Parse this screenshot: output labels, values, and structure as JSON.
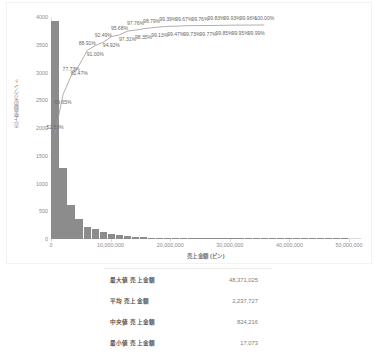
{
  "chart_data": {
    "type": "bar",
    "title": "",
    "xlabel": "売上金額 (ビン)",
    "ylabel": "売上金額のカウント",
    "xlim": [
      0,
      52000000
    ],
    "ylim": [
      0,
      4000
    ],
    "grid": false,
    "legend": "none",
    "xticks": [
      "0",
      "10,000,000",
      "20,000,000",
      "30,000,000",
      "40,000,000",
      "50,000,000"
    ],
    "xtick_values": [
      0,
      10000000,
      20000000,
      30000000,
      40000000,
      50000000
    ],
    "yticks": [
      "0",
      "500",
      "1000",
      "1500",
      "2000",
      "2500",
      "3000",
      "3500",
      "4000"
    ],
    "ytick_values": [
      0,
      500,
      1000,
      1500,
      2000,
      2500,
      3000,
      3500,
      4000
    ],
    "bin_width": 1350000,
    "categories": [
      "0",
      "1,350,000",
      "2,700,000",
      "4,050,000",
      "5,400,000",
      "6,750,000",
      "8,100,000",
      "9,450,000",
      "10,800,000",
      "12,150,000",
      "13,500,000",
      "14,850,000",
      "16,200,000",
      "17,550,000",
      "18,900,000",
      "20,250,000",
      "21,600,000",
      "22,950,000",
      "24,300,000",
      "25,650,000",
      "27,000,000",
      "28,350,000",
      "29,700,000",
      "31,050,000",
      "32,400,000",
      "33,750,000",
      "35,100,000",
      "36,450,000",
      "37,800,000",
      "39,150,000",
      "40,500,000",
      "41,850,000",
      "43,200,000",
      "44,550,000",
      "45,900,000",
      "47,250,000",
      "48,600,000"
    ],
    "values": [
      3925,
      1280,
      604,
      361,
      222,
      176,
      122,
      92,
      69,
      54,
      41,
      33,
      26,
      20,
      16,
      13,
      11,
      9,
      7,
      6,
      5,
      4,
      4,
      3,
      3,
      2,
      2,
      2,
      1,
      1,
      1,
      1,
      1,
      1,
      1,
      1,
      1
    ],
    "cumulative_label": "累積 %",
    "cumulative_percent": [
      52.53,
      69.65,
      77.73,
      82.47,
      88.91,
      91.0,
      92.49,
      94.92,
      95.68,
      97.31,
      97.76,
      98.35,
      98.79,
      99.13,
      99.39,
      99.47,
      99.67,
      99.73,
      99.76,
      99.77,
      99.83,
      99.85,
      99.93,
      99.95,
      99.96,
      99.99,
      100.0
    ],
    "cumulative_labels": [
      "52.53%",
      "69.65%",
      "77.73%",
      "82.47%",
      "88.91%",
      "91.00%",
      "92.49%",
      "94.92%",
      "95.68%",
      "97.31%",
      "97.76%",
      "98.35%",
      "98.79%",
      "99.13%",
      "99.39%",
      "99.47%",
      "99.67%",
      "99.73%",
      "99.76%",
      "99.77%",
      "99.83%",
      "99.85%",
      "99.93%",
      "99.95%",
      "99.96%",
      "99.99%",
      "100.00%"
    ]
  },
  "stats": {
    "rows": [
      {
        "label": "最大値 売上金額",
        "value": "48,371,025"
      },
      {
        "label": "平均 売上金額",
        "value": "2,237,727"
      },
      {
        "label": "中央値 売上金額",
        "value": "824,216"
      },
      {
        "label": "最小値 売上金額",
        "value": "17,073"
      }
    ]
  },
  "colors": {
    "bar": "#8c8c8c",
    "line": "#9a9a9a",
    "axis": "#d9d9d9",
    "text": "#7d7d7d"
  }
}
